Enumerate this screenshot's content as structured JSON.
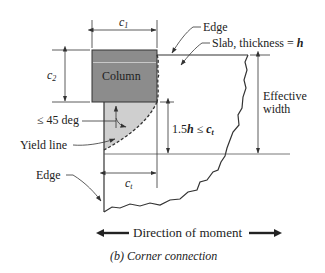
{
  "diagram": {
    "title": "Corner connection",
    "caption": "(b) Corner connection",
    "labels": {
      "c1": {
        "main": "c",
        "sub": "1"
      },
      "c2": {
        "main": "c",
        "sub": "2"
      },
      "ct": {
        "main": "c",
        "sub": "t"
      },
      "column": "Column",
      "edge_top": "Edge",
      "slab_prefix": "Slab, thickness = ",
      "slab_var": "h",
      "angle": "≤ 45 deg",
      "yield_line": "Yield line",
      "edge_left": "Edge",
      "depth_prefix": "1.5",
      "depth_var": "h",
      "depth_op": " ≤ ",
      "depth_rhs": {
        "main": "c",
        "sub": "t"
      },
      "effective_line1": "Effective",
      "effective_line2": "width",
      "direction": "Direction of moment"
    },
    "colors": {
      "column_fill": "#8c8c8c",
      "yield_zone_fill": "#cfcfcf",
      "line": "#333333",
      "background": "#ffffff"
    },
    "icons": [
      "arrow-left-icon",
      "arrow-right-icon"
    ]
  }
}
